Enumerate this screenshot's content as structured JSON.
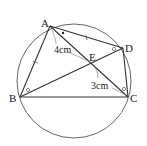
{
  "points": {
    "A": {
      "label": "A",
      "x": 50,
      "y": 26
    },
    "B": {
      "label": "B",
      "x": 20,
      "y": 97
    },
    "C": {
      "label": "C",
      "x": 128,
      "y": 97
    },
    "D": {
      "label": "D",
      "x": 123,
      "y": 48
    },
    "E": {
      "label": "E",
      "x": 92,
      "y": 62
    }
  },
  "circle": {
    "cx": 74,
    "cy": 81,
    "r": 57
  },
  "measurements": {
    "AE": "4cm",
    "EC": "3cm"
  },
  "colors": {
    "stroke": "#333333",
    "circle": "#555555",
    "label": "#222222"
  }
}
